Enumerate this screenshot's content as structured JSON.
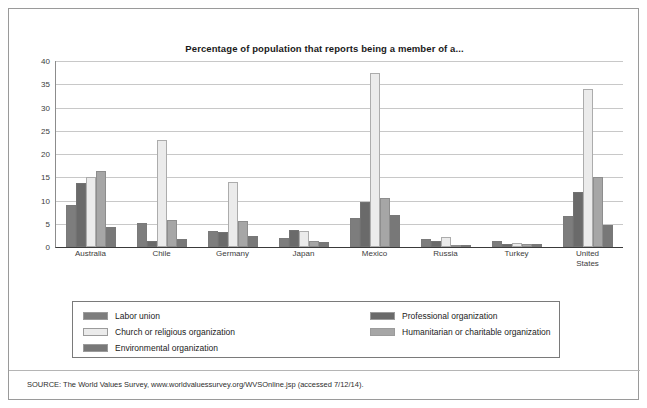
{
  "chart_data": {
    "type": "bar",
    "title": "Percentage of population that reports being a member of a...",
    "xlabel": "",
    "ylabel": "",
    "ylim": [
      0,
      40
    ],
    "yticks": [
      0,
      5,
      10,
      15,
      20,
      25,
      30,
      35,
      40
    ],
    "grid": true,
    "legend_position": "bottom",
    "categories": [
      "Australia",
      "Chile",
      "Germany",
      "Japan",
      "Mexico",
      "Russia",
      "Turkey",
      "United\nStates"
    ],
    "series": [
      {
        "name": "Labor union",
        "color": "#7d7d7d",
        "values": [
          9.0,
          5.1,
          3.4,
          1.9,
          6.3,
          1.7,
          1.2,
          6.6
        ]
      },
      {
        "name": "Professional organization",
        "color": "#6a6a6a",
        "values": [
          13.7,
          1.3,
          3.2,
          3.7,
          9.6,
          1.3,
          0.6,
          11.9
        ]
      },
      {
        "name": "Church or religious organization",
        "color": "#ebebeb",
        "values": [
          15.0,
          23.0,
          14.0,
          3.5,
          37.5,
          2.1,
          0.8,
          34.0
        ]
      },
      {
        "name": "Humanitarian or charitable organization",
        "color": "#a6a6a6",
        "values": [
          16.3,
          5.9,
          5.6,
          1.4,
          10.6,
          0.4,
          0.7,
          15.0
        ]
      },
      {
        "name": "Environmental organization",
        "color": "#787878",
        "values": [
          4.3,
          1.7,
          2.3,
          1.0,
          6.8,
          0.2,
          0.7,
          4.8
        ]
      }
    ]
  },
  "legend": {
    "left_items": [
      {
        "label": "Labor union",
        "color": "#7d7d7d"
      },
      {
        "label": "Church or religious organization",
        "color": "#ebebeb"
      },
      {
        "label": "Environmental organization",
        "color": "#787878"
      }
    ],
    "right_items": [
      {
        "label": "Professional organization",
        "color": "#6a6a6a"
      },
      {
        "label": "Humanitarian or charitable organization",
        "color": "#a6a6a6"
      }
    ]
  },
  "source": {
    "text": "SOURCE: The World Values Survey, www.worldvaluessurvey.org/WVSOnline.jsp (accessed 7/12/14)."
  }
}
